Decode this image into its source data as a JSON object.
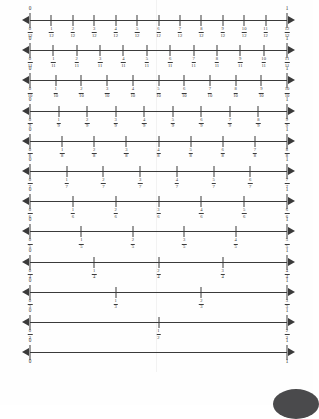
{
  "page": {
    "background": "#fefefe",
    "ink": "#3a3a3a",
    "endpoint_left_label": "0",
    "endpoint_right_label": "1"
  },
  "chart_data": {
    "type": "line",
    "title": "",
    "subtitle": "",
    "xlabel": "",
    "ylabel": "",
    "xlim": [
      0,
      1
    ],
    "grid": false,
    "legend": "none",
    "series": [
      {
        "name": "twelfths",
        "denominator": 12,
        "left_label": "0",
        "right_label": "1",
        "x": [
          0,
          0.0833,
          0.1667,
          0.25,
          0.3333,
          0.4167,
          0.5,
          0.5833,
          0.6667,
          0.75,
          0.8333,
          0.9167,
          1
        ],
        "numerators": [
          0,
          1,
          2,
          3,
          4,
          5,
          6,
          7,
          8,
          9,
          10,
          11,
          12
        ],
        "labels": [
          "0/12",
          "1/12",
          "2/12",
          "3/12",
          "4/12",
          "5/12",
          "6/12",
          "7/12",
          "8/12",
          "9/12",
          "10/12",
          "11/12",
          "12/12"
        ]
      },
      {
        "name": "elevenths",
        "denominator": 11,
        "left_label": "0",
        "right_label": "1",
        "x": [
          0,
          0.0909,
          0.1818,
          0.2727,
          0.3636,
          0.4545,
          0.5455,
          0.6364,
          0.7273,
          0.8182,
          0.9091,
          1
        ],
        "numerators": [
          0,
          1,
          2,
          3,
          4,
          5,
          6,
          7,
          8,
          9,
          10,
          11
        ],
        "labels": [
          "0/11",
          "1/11",
          "2/11",
          "3/11",
          "4/11",
          "5/11",
          "6/11",
          "7/11",
          "8/11",
          "9/11",
          "10/11",
          "11/11"
        ]
      },
      {
        "name": "tenths",
        "denominator": 10,
        "left_label": "0",
        "right_label": "1",
        "x": [
          0,
          0.1,
          0.2,
          0.3,
          0.4,
          0.5,
          0.6,
          0.7,
          0.8,
          0.9,
          1
        ],
        "numerators": [
          0,
          1,
          2,
          3,
          4,
          5,
          6,
          7,
          8,
          9,
          10
        ],
        "labels": [
          "0/10",
          "1/10",
          "2/10",
          "3/10",
          "4/10",
          "5/10",
          "6/10",
          "7/10",
          "8/10",
          "9/10",
          "10/10"
        ]
      },
      {
        "name": "ninths",
        "denominator": 9,
        "left_label": "0",
        "right_label": "1",
        "x": [
          0,
          0.1111,
          0.2222,
          0.3333,
          0.4444,
          0.5556,
          0.6667,
          0.7778,
          0.8889,
          1
        ],
        "numerators": [
          0,
          1,
          2,
          3,
          4,
          5,
          6,
          7,
          8,
          9
        ],
        "labels": [
          "0/9",
          "1/9",
          "2/9",
          "3/9",
          "4/9",
          "5/9",
          "6/9",
          "7/9",
          "8/9",
          "9/9"
        ]
      },
      {
        "name": "eighths",
        "denominator": 8,
        "left_label": "0",
        "right_label": "1",
        "x": [
          0,
          0.125,
          0.25,
          0.375,
          0.5,
          0.625,
          0.75,
          0.875,
          1
        ],
        "numerators": [
          0,
          1,
          2,
          3,
          4,
          5,
          6,
          7,
          8
        ],
        "labels": [
          "0/8",
          "1/8",
          "2/8",
          "3/8",
          "4/8",
          "5/8",
          "6/8",
          "7/8",
          "8/8"
        ]
      },
      {
        "name": "sevenths",
        "denominator": 7,
        "left_label": "0",
        "right_label": "1",
        "x": [
          0,
          0.1429,
          0.2857,
          0.4286,
          0.5714,
          0.7143,
          0.8571,
          1
        ],
        "numerators": [
          0,
          1,
          2,
          3,
          4,
          5,
          6,
          7
        ],
        "labels": [
          "0/7",
          "1/7",
          "2/7",
          "3/7",
          "4/7",
          "5/7",
          "6/7",
          "7/7"
        ]
      },
      {
        "name": "sixths",
        "denominator": 6,
        "left_label": "0",
        "right_label": "1",
        "x": [
          0,
          0.1667,
          0.3333,
          0.5,
          0.6667,
          0.8333,
          1
        ],
        "numerators": [
          0,
          1,
          2,
          3,
          4,
          5,
          6
        ],
        "labels": [
          "0/6",
          "1/6",
          "2/6",
          "3/6",
          "4/6",
          "5/6",
          "6/6"
        ]
      },
      {
        "name": "fifths",
        "denominator": 5,
        "left_label": "0",
        "right_label": "1",
        "x": [
          0,
          0.2,
          0.4,
          0.6,
          0.8,
          1
        ],
        "numerators": [
          0,
          1,
          2,
          3,
          4,
          5
        ],
        "labels": [
          "0/5",
          "1/5",
          "2/5",
          "3/5",
          "4/5",
          "5/5"
        ]
      },
      {
        "name": "fourths",
        "denominator": 4,
        "left_label": "0",
        "right_label": "1",
        "x": [
          0,
          0.25,
          0.5,
          0.75,
          1
        ],
        "numerators": [
          0,
          1,
          2,
          3,
          4
        ],
        "labels": [
          "0/4",
          "1/4",
          "2/4",
          "3/4",
          "4/4"
        ]
      },
      {
        "name": "thirds",
        "denominator": 3,
        "left_label": "0",
        "right_label": "1",
        "x": [
          0,
          0.3333,
          0.6667,
          1
        ],
        "numerators": [
          0,
          1,
          2,
          3
        ],
        "labels": [
          "0/3",
          "1/3",
          "2/3",
          "3/3"
        ]
      },
      {
        "name": "halves",
        "denominator": 2,
        "left_label": "0",
        "right_label": "1",
        "x": [
          0,
          0.5,
          1
        ],
        "numerators": [
          0,
          1,
          2
        ],
        "labels": [
          "0/2",
          "1/2",
          "2/2"
        ]
      },
      {
        "name": "whole",
        "denominator": 1,
        "left_label": "0",
        "right_label": "1",
        "x": [
          0,
          1
        ],
        "numerators": [
          0,
          1
        ],
        "labels": [
          "0",
          "1"
        ]
      }
    ]
  }
}
